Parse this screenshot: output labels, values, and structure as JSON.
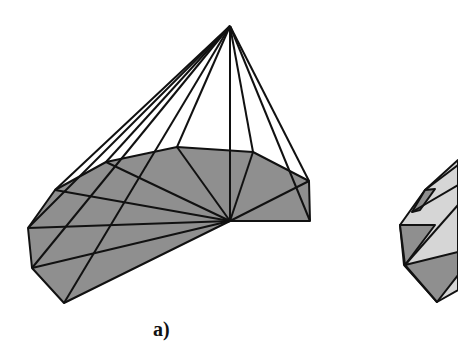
{
  "figure": {
    "panels": [
      {
        "id": "a",
        "caption": "a)",
        "description": "Pyramid-like cone from an apex point over a triangulated polygonal base (fan triangulation)"
      },
      {
        "id": "b",
        "caption": "",
        "description": "Partially visible second polyhedron with alternating light and dark facets"
      }
    ],
    "colors": {
      "base_fill": "#8f8f8f",
      "light_facet": "#d6d6d6",
      "dark_facet": "#8f8f8f",
      "edge": "#111111",
      "background": "#ffffff"
    }
  }
}
